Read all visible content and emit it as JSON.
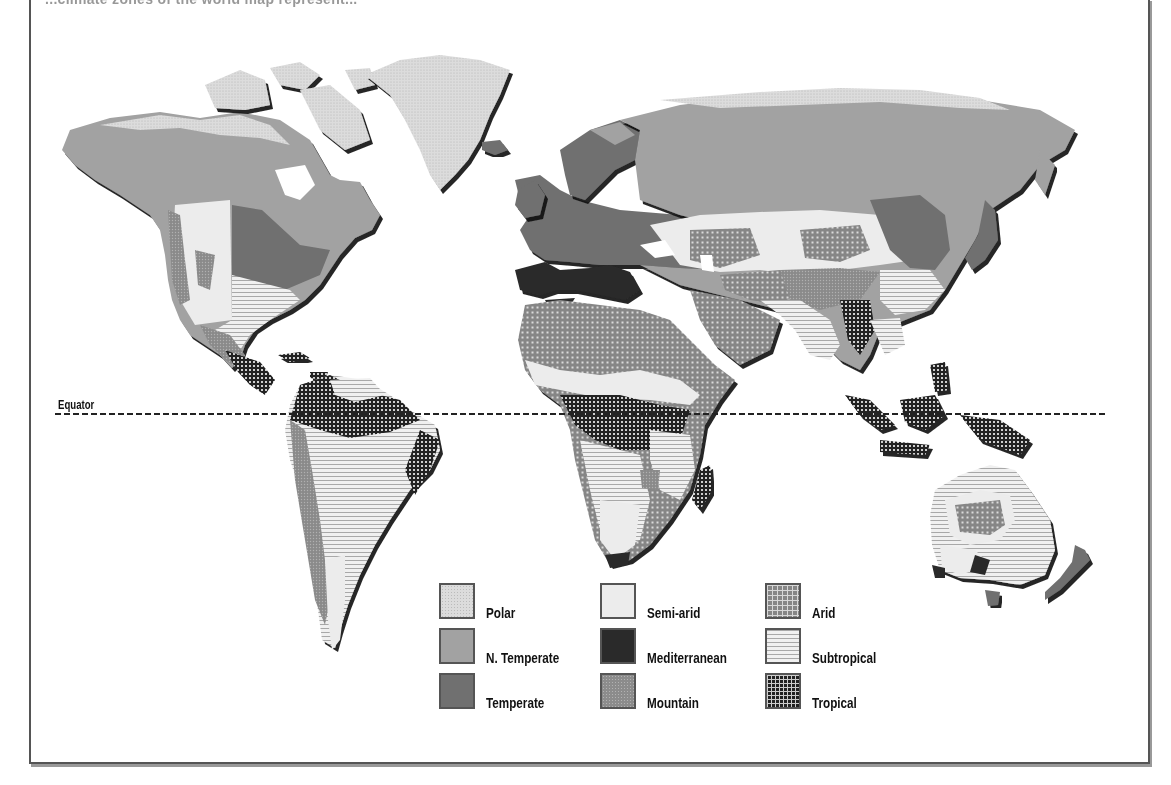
{
  "header": {
    "partial_text": "...climate zones of the world map represent..."
  },
  "map": {
    "equator_label": "Equator"
  },
  "legend": {
    "items": [
      {
        "key": "polar",
        "label": "Polar",
        "color": "#dcdcdc",
        "pattern": "speckled"
      },
      {
        "key": "n_temperate",
        "label": "N. Temperate",
        "color": "#a2a2a2",
        "pattern": "solid"
      },
      {
        "key": "temperate",
        "label": "Temperate",
        "color": "#707070",
        "pattern": "solid"
      },
      {
        "key": "semi_arid",
        "label": "Semi-arid",
        "color": "#ececec",
        "pattern": "solid"
      },
      {
        "key": "mediterranean",
        "label": "Mediterranean",
        "color": "#2a2a2a",
        "pattern": "solid"
      },
      {
        "key": "mountain",
        "label": "Mountain",
        "color": "#8c8c8c",
        "pattern": "speckled"
      },
      {
        "key": "arid",
        "label": "Arid",
        "color": "#868686",
        "pattern": "dotted-grid"
      },
      {
        "key": "subtropical",
        "label": "Subtropical",
        "color": "#f0f0f0",
        "pattern": "horizontal-lines"
      },
      {
        "key": "tropical",
        "label": "Tropical",
        "color": "#222222",
        "pattern": "dense-grid"
      }
    ]
  }
}
